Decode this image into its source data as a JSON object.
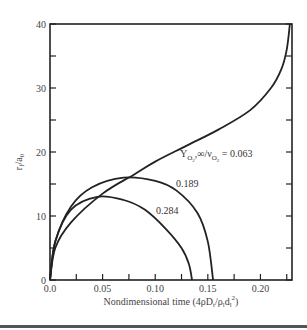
{
  "chart_data": {
    "type": "line",
    "title": "",
    "xlabel": "Nondimensional time (4ρD_t/ρ_l d_l^2)",
    "ylabel": "r_f/a_0",
    "xlim": [
      0.0,
      0.23
    ],
    "ylim": [
      0,
      40
    ],
    "x_ticks": [
      "0.0",
      "0.05",
      "0.10",
      "0.15",
      "0.20"
    ],
    "y_ticks": [
      "0",
      "10",
      "20",
      "30",
      "40"
    ],
    "grid": false,
    "series": [
      {
        "name": "Y_O2,∞/ν_O2 = 0.063",
        "x": [
          0.0,
          0.005,
          0.02,
          0.05,
          0.08,
          0.1,
          0.13,
          0.16,
          0.19,
          0.21,
          0.22,
          0.225,
          0.228
        ],
        "y": [
          0,
          5,
          9,
          13.5,
          16.5,
          18.5,
          21,
          23.5,
          26.5,
          30,
          33,
          36,
          40
        ]
      },
      {
        "name": "0.189",
        "x": [
          0.0,
          0.005,
          0.02,
          0.04,
          0.07,
          0.1,
          0.12,
          0.14,
          0.15,
          0.155
        ],
        "y": [
          0,
          6,
          11.5,
          14.5,
          16,
          15.5,
          14,
          10.5,
          6,
          0
        ]
      },
      {
        "name": "0.284",
        "x": [
          0.0,
          0.005,
          0.02,
          0.045,
          0.07,
          0.09,
          0.11,
          0.125,
          0.132,
          0.135
        ],
        "y": [
          0,
          6,
          11,
          13,
          12.5,
          11,
          8,
          5,
          2.5,
          0
        ]
      }
    ],
    "annotations": [
      {
        "text": "Y_O2,∞/ν_O2 = 0.063",
        "near": "upper curve"
      },
      {
        "text": "0.189"
      },
      {
        "text": "0.284"
      }
    ]
  },
  "labels": {
    "xlabel_main": "Nondimensional time (4ρD",
    "xlabel_t": "t",
    "xlabel_slash": "/ρ",
    "xlabel_l": "l",
    "xlabel_d": "d",
    "xlabel_sub": "l",
    "xlabel_sup": "2",
    "xlabel_end": ")",
    "ylabel_r": "r",
    "ylabel_f": "f",
    "ylabel_rest": "/a",
    "ylabel_0": "0",
    "anno_063_Y": "Y",
    "anno_063_sub1": "O",
    "anno_063_sub2": "2",
    "anno_063_mid": ",∞/ν",
    "anno_063_end": " = 0.063",
    "anno_189": "0.189",
    "anno_284": "0.284"
  }
}
